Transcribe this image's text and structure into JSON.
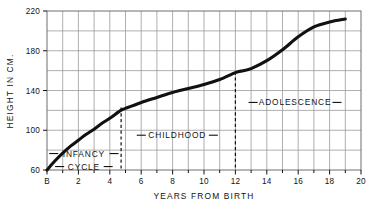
{
  "chart_data": {
    "type": "line",
    "title": "",
    "xlabel": "YEARS FROM BIRTH",
    "ylabel": "HEIGHT IN CM.",
    "xlim": [
      0,
      20
    ],
    "ylim": [
      60,
      220
    ],
    "grid": true,
    "grid_x_step": 1,
    "grid_y_step": 20,
    "legend": "none",
    "x_tick_labels": [
      "B",
      "2",
      "4",
      "6",
      "8",
      "10",
      "12",
      "14",
      "16",
      "18",
      "20"
    ],
    "x_tick_values": [
      0,
      2,
      4,
      6,
      8,
      10,
      12,
      14,
      16,
      18,
      20
    ],
    "y_tick_labels": [
      "60",
      "100",
      "140",
      "180",
      "220"
    ],
    "y_tick_values": [
      60,
      100,
      140,
      180,
      220
    ],
    "series": [
      {
        "name": "height",
        "x": [
          0,
          0.5,
          1,
          1.5,
          2,
          2.5,
          3,
          3.5,
          4,
          4.7,
          5,
          6,
          7,
          8,
          9,
          10,
          11,
          12,
          12.5,
          13,
          14,
          15,
          16,
          17,
          18,
          19
        ],
        "values": [
          60,
          69,
          77,
          84,
          90,
          96,
          101,
          107,
          112,
          120,
          122,
          128,
          133,
          138,
          142,
          146,
          151,
          158,
          160,
          162,
          170,
          181,
          194,
          204,
          209,
          212
        ]
      }
    ],
    "annotations": [
      {
        "name": "infancy",
        "lines": [
          "INFANCY",
          "CYCLE"
        ],
        "x_center": 2.35,
        "y_center": 70,
        "leader_dashes": true
      },
      {
        "name": "childhood",
        "lines": [
          "CHILDHOOD"
        ],
        "x_center": 8.3,
        "y_center": 95,
        "leader_dashes": true
      },
      {
        "name": "adolescence",
        "lines": [
          "ADOLESCENCE"
        ],
        "x_center": 15.8,
        "y_center": 128,
        "leader_dashes": true
      }
    ],
    "dividers": [
      {
        "name": "infancy-childhood-divider",
        "x": 4.72,
        "style": "dashed"
      },
      {
        "name": "childhood-adolescence-divider",
        "x": 12.0,
        "style": "dashed"
      }
    ]
  },
  "colors": {
    "background": "#ffffff",
    "curve": "#111111",
    "grid": "#9a9a9a",
    "frame": "#6e6e6e",
    "text": "#121212",
    "divider": "#111111"
  },
  "axes": {
    "x_title": "YEARS FROM BIRTH",
    "y_title": "HEIGHT IN CM."
  }
}
